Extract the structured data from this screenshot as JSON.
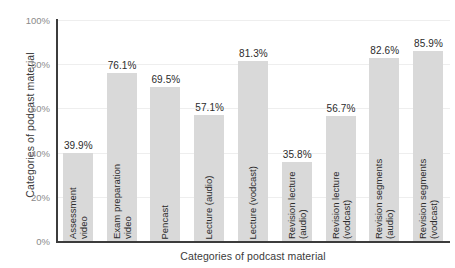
{
  "chart_data": {
    "type": "bar",
    "title": "",
    "xlabel": "Categories of podcast material",
    "ylabel": "Categories of podcast material",
    "ylim": [
      0,
      100
    ],
    "grid": true,
    "legend": "none",
    "y_ticks": [
      "0%",
      "20%",
      "40%",
      "60%",
      "80%",
      "100%"
    ],
    "y_tick_values": [
      0,
      20,
      40,
      60,
      80,
      100
    ],
    "categories": [
      "Assessment video",
      "Exam preparation video",
      "Pencast",
      "Lecture (audio)",
      "Lecture (vodcast)",
      "Revision lecture (audio)",
      "Revision lecture (vodcast)",
      "Revision segments (audio)",
      "Revision segments (vodcast)"
    ],
    "category_lines": [
      [
        "Assessment",
        "video"
      ],
      [
        "Exam preparation",
        "video"
      ],
      [
        "Pencast"
      ],
      [
        "Lecture (audio)"
      ],
      [
        "Lecture (vodcast)"
      ],
      [
        "Revision lecture",
        "(audio)"
      ],
      [
        "Revision lecture",
        "(vodcast)"
      ],
      [
        "Revision segments",
        "(audio)"
      ],
      [
        "Revision segments",
        "(vodcast)"
      ]
    ],
    "values": [
      39.9,
      76.1,
      69.5,
      57.1,
      81.3,
      35.8,
      56.7,
      82.6,
      85.9
    ],
    "value_labels": [
      "39.9%",
      "76.1%",
      "69.5%",
      "57.1%",
      "81.3%",
      "35.8%",
      "56.7%",
      "82.6%",
      "85.9%"
    ],
    "bar_color": "#d9d9d9",
    "axis_color": "#3c3c3c",
    "grid_color": "#eeeeee",
    "tick_label_color": "#8a8a8a",
    "value_label_color": "#2b2b2b"
  }
}
